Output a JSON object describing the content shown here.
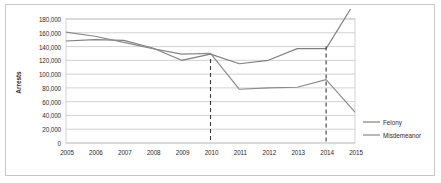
{
  "chart_data": {
    "type": "line",
    "title": "",
    "xlabel": "",
    "ylabel": "Arrests",
    "x": [
      2005,
      2006,
      2007,
      2008,
      2009,
      2010,
      2011,
      2012,
      2013,
      2014,
      2015
    ],
    "categories": [
      "2005",
      "2006",
      "2007",
      "2008",
      "2009",
      "2010",
      "2011",
      "2012",
      "2013",
      "2014",
      "2015"
    ],
    "ylim": [
      0,
      180000
    ],
    "ytick_values": [
      0,
      20000,
      40000,
      60000,
      80000,
      100000,
      120000,
      140000,
      160000,
      180000
    ],
    "ytick_labels": [
      "0",
      "20,000",
      "40,000",
      "60,000",
      "80,000",
      "100,000",
      "120,000",
      "140,000",
      "160,000",
      "180,000"
    ],
    "grid": "horizontal",
    "legend_position": "right",
    "series": [
      {
        "name": "Felony",
        "color": "#808080",
        "values": [
          148000,
          150000,
          149000,
          138000,
          120000,
          129000,
          115000,
          120000,
          137000,
          137000,
          205000
        ]
      },
      {
        "name": "Misdemeanor",
        "color": "#8a8a8a",
        "values": [
          161000,
          155000,
          146000,
          137000,
          129000,
          130000,
          78000,
          80000,
          81000,
          92000,
          45000
        ]
      }
    ],
    "annotations": [
      {
        "name": "decriminalization-of-marijuana",
        "line1": "Decriminalization of",
        "line2": "Marijuana",
        "x_value": 2010,
        "marker": "dashed-vertical-line"
      },
      {
        "name": "proposition-47",
        "line1": "Proposition 47",
        "line2": "",
        "x_value": 2014,
        "marker": "dashed-vertical-line"
      }
    ]
  },
  "legend": {
    "items": [
      {
        "label": "Felony"
      },
      {
        "label": "Misdemeanor"
      }
    ]
  }
}
